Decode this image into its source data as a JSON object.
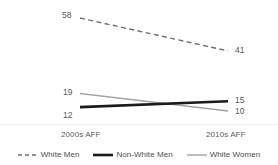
{
  "chart_data": {
    "type": "line",
    "title": "",
    "subtitle": "",
    "xlabel": "",
    "ylabel": "",
    "categories": [
      "2000s AFF",
      "2010s AFF"
    ],
    "x": [
      0,
      1
    ],
    "grid": false,
    "legend_position": "bottom",
    "ylim": [
      0,
      65
    ],
    "series": [
      {
        "name": "White Men",
        "values": [
          58,
          41
        ],
        "labels": [
          "58",
          "41"
        ],
        "style": "dashed",
        "color": "#6e6e70",
        "width": 1.4
      },
      {
        "name": "Non-White Men",
        "values": [
          12,
          15
        ],
        "labels": [
          "12",
          "15"
        ],
        "style": "solid",
        "color": "#1b1b1b",
        "width": 2.6
      },
      {
        "name": "White Women",
        "values": [
          19,
          10
        ],
        "labels": [
          "19",
          "10"
        ],
        "style": "solid",
        "color": "#a3a3a5",
        "width": 1.4
      }
    ]
  },
  "axis": {
    "left_tick": "2000s AFF",
    "right_tick": "2010s AFF"
  },
  "legend": {
    "items": [
      {
        "label": "White Men"
      },
      {
        "label": "Non-White Men"
      },
      {
        "label": "White Women"
      }
    ]
  },
  "value_labels": {
    "white_men_left": "58",
    "white_men_right": "41",
    "white_women_left": "19",
    "white_women_right": "10",
    "nonwhite_men_left": "12",
    "nonwhite_men_right": "15"
  },
  "colors": {
    "white_men": "#6e6e70",
    "non_white_men": "#1b1b1b",
    "white_women": "#a3a3a5",
    "text": "#58585a",
    "background": "#ffffff",
    "separator": "#f0f0f0"
  }
}
